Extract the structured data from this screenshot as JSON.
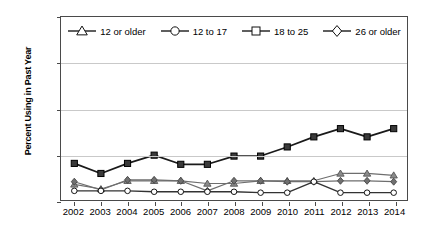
{
  "chart_data": {
    "type": "line",
    "title": "",
    "xlabel": "",
    "ylabel": "Percent Using in Past Year",
    "ylim": [
      0.0,
      2.0
    ],
    "ytick_labels": [
      "0.0",
      "0.5",
      "1.0",
      "1.5",
      "2.0"
    ],
    "ytick_values": [
      0.0,
      0.5,
      1.0,
      1.5,
      2.0
    ],
    "grid": true,
    "legend_position": "top-center-inside",
    "categories": [
      "2002",
      "2003",
      "2004",
      "2005",
      "2006",
      "2007",
      "2008",
      "2009",
      "2010",
      "2011",
      "2012",
      "2013",
      "2014"
    ],
    "series": [
      {
        "name": "12 or older",
        "marker": "triangle",
        "values": [
          0.17,
          0.12,
          0.21,
          0.21,
          0.21,
          0.18,
          0.18,
          0.21,
          0.21,
          0.21,
          0.29,
          0.29,
          0.27
        ]
      },
      {
        "name": "12 to 17",
        "marker": "circle",
        "values": [
          0.1,
          0.1,
          0.1,
          0.09,
          0.09,
          0.09,
          0.09,
          0.08,
          0.08,
          0.2,
          0.08,
          0.08,
          0.08
        ]
      },
      {
        "name": "18 to 25",
        "marker": "square",
        "values": [
          0.4,
          0.29,
          0.4,
          0.49,
          0.39,
          0.39,
          0.48,
          0.48,
          0.58,
          0.69,
          0.78,
          0.69,
          0.78
        ]
      },
      {
        "name": "26 or older",
        "marker": "diamond",
        "values": [
          0.2,
          0.11,
          0.22,
          0.22,
          0.21,
          0.1,
          0.21,
          0.21,
          0.2,
          0.2,
          0.21,
          0.21,
          0.2
        ]
      }
    ]
  },
  "legend": {
    "items": [
      {
        "label": "12 or older",
        "marker": "triangle"
      },
      {
        "label": "12 to 17",
        "marker": "circle"
      },
      {
        "label": "18 to 25",
        "marker": "square"
      },
      {
        "label": "26 or older",
        "marker": "diamond"
      }
    ]
  },
  "colors": {
    "axis": "#4a4a4a",
    "grid": "#c9c9c9",
    "line_dark": "#1a1a1a",
    "line_gray": "#6e6e6e",
    "marker_fill_dark": "#3a3a3a",
    "marker_fill_light": "#ffffff",
    "text": "#000000"
  }
}
